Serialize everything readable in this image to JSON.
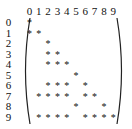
{
  "matrix": {
    "column_headers": [
      "0",
      "1",
      "2",
      "3",
      "4",
      "5",
      "6",
      "7",
      "8",
      "9"
    ],
    "row_labels": [
      "0",
      "1",
      "2",
      "3",
      "4",
      "5",
      "6",
      "7",
      "8",
      "9"
    ],
    "symbol": "*",
    "rows": [
      {
        "row": 0,
        "cols": [
          0
        ]
      },
      {
        "row": 1,
        "cols": [
          0,
          1
        ]
      },
      {
        "row": 2,
        "cols": [
          2
        ]
      },
      {
        "row": 3,
        "cols": [
          2,
          3
        ]
      },
      {
        "row": 4,
        "cols": [
          2,
          3,
          4
        ]
      },
      {
        "row": 5,
        "cols": [
          5
        ]
      },
      {
        "row": 6,
        "cols": [
          2,
          3,
          4,
          6
        ]
      },
      {
        "row": 7,
        "cols": [
          1,
          2,
          3,
          4,
          6,
          7
        ]
      },
      {
        "row": 8,
        "cols": [
          5,
          8
        ]
      },
      {
        "row": 9,
        "cols": [
          1,
          2,
          3,
          4,
          6,
          7,
          8,
          9
        ]
      }
    ]
  }
}
